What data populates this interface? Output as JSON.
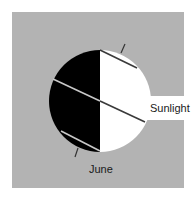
{
  "diagram": {
    "labels": {
      "sunlight": "Sunlight",
      "month": "June"
    },
    "colors": {
      "background": "#b3b3b3",
      "night": "#000000",
      "day": "#ffffff",
      "lines": "#4a4a4a"
    },
    "elements": [
      {
        "name": "earth-globe",
        "shape": "circle",
        "cx": 100,
        "cy": 101,
        "r": 51
      },
      {
        "name": "night-side",
        "side": "left"
      },
      {
        "name": "day-side",
        "side": "right"
      },
      {
        "name": "sunlight-beam",
        "direction": "from right"
      },
      {
        "name": "rotation-axis",
        "tilt": "tilted"
      },
      {
        "name": "latitude-lines",
        "count": 3
      }
    ]
  }
}
